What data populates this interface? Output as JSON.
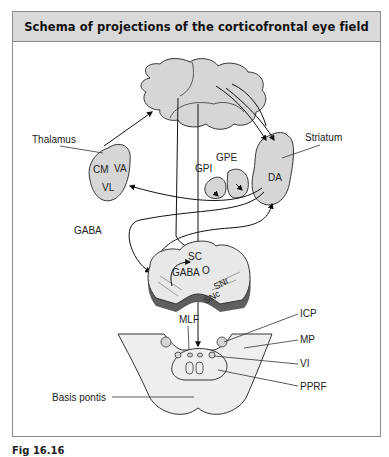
{
  "figure": {
    "title": "Schema of projections of the corticofrontal eye field",
    "caption_number": "Fig 16.16",
    "caption_text": "Schema of projections of the corticofrontal eye field (visible portion clipped)"
  },
  "labels": {
    "thalamus": "Thalamus",
    "cm": "CM",
    "va": "VA",
    "vl": "VL",
    "striatum": "Striatum",
    "da": "DA",
    "gpi": "GPI",
    "gpe": "GPE",
    "gaba_outer": "GABA",
    "sc": "SC",
    "gaba_inner": "GABA",
    "o": "O",
    "snr": "SNr",
    "snc": "SNc",
    "mlf": "MLF",
    "icp": "ICP",
    "mp": "MP",
    "vi": "VI",
    "pprf": "PPRF",
    "basis_pontis": "Basis pontis"
  },
  "colors": {
    "header_bg": "#d9d9d9",
    "structure_fill": "#d6d6d6",
    "pons_fill": "#eeeeee",
    "midbrain_shadow": "#5e5e5e",
    "stroke": "#333333",
    "frame": "#8a8a8a"
  }
}
